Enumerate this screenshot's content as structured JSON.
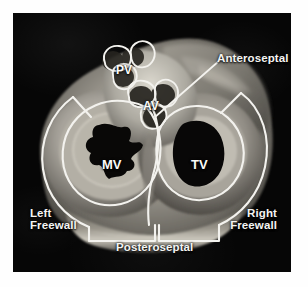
{
  "figure": {
    "kind": "anatomic-specimen-photograph",
    "view": "short-axis cross-section of the heart at the valve plane",
    "plate_background": "#060606",
    "annotation_color": "#f4f4f2",
    "page_background": "#fefefe"
  },
  "region_labels": [
    {
      "id": "anteroseptal",
      "text": "Anteroseptal",
      "position": "upper-right",
      "has_leader_line": true
    },
    {
      "id": "posteroseptal",
      "text": "Posteroseptal",
      "position": "bottom-center",
      "has_leader_line": false
    },
    {
      "id": "left-freewall",
      "text": "Left\nFreewall",
      "position": "lower-left",
      "has_leader_line": false
    },
    {
      "id": "right-freewall",
      "text": "Right\nFreewall",
      "position": "lower-right",
      "has_leader_line": false
    }
  ],
  "valve_labels": [
    {
      "id": "pv",
      "text": "PV",
      "name": "pulmonary valve"
    },
    {
      "id": "av",
      "text": "AV",
      "name": "aortic valve"
    },
    {
      "id": "mv",
      "text": "MV",
      "name": "mitral valve"
    },
    {
      "id": "tv",
      "text": "TV",
      "name": "tricuspid valve"
    }
  ]
}
